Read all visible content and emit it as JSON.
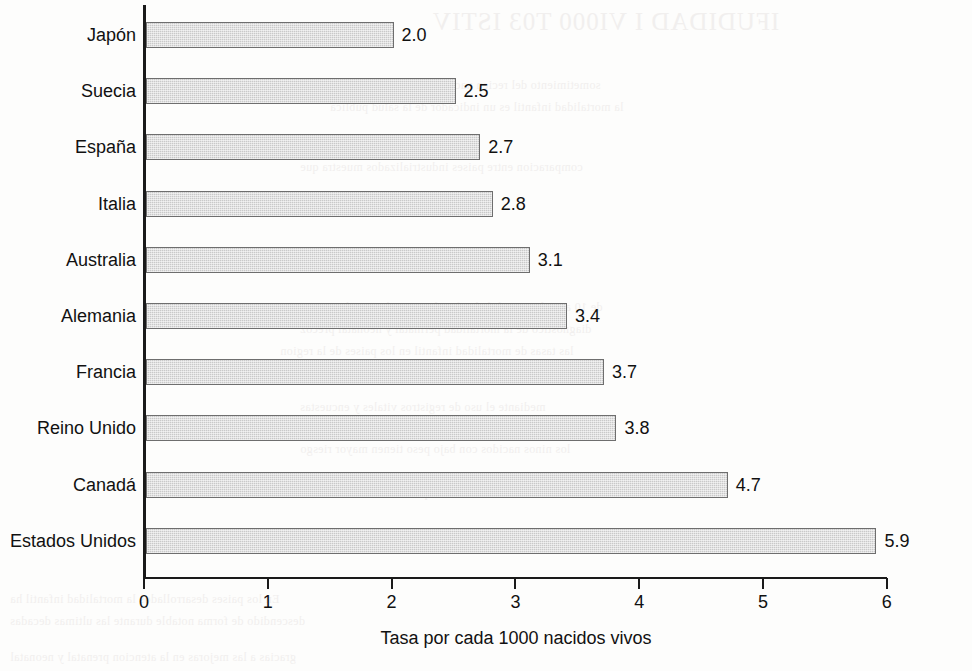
{
  "chart_data": {
    "type": "bar",
    "orientation": "horizontal",
    "title": "",
    "xlabel": "Tasa por cada 1000 nacidos vivos",
    "ylabel": "",
    "xlim": [
      0,
      6
    ],
    "grid": false,
    "legend": false,
    "xticks": [
      "0",
      "1",
      "2",
      "3",
      "4",
      "5",
      "6"
    ],
    "categories": [
      "Japón",
      "Suecia",
      "España",
      "Italia",
      "Australia",
      "Alemania",
      "Francia",
      "Reino Unido",
      "Canadá",
      "Estados Unidos"
    ],
    "values": [
      2.0,
      2.5,
      2.7,
      2.8,
      3.1,
      3.4,
      3.7,
      3.8,
      4.7,
      5.9
    ],
    "value_labels": [
      "2.0",
      "2.5",
      "2.7",
      "2.8",
      "3.1",
      "3.4",
      "3.7",
      "3.8",
      "4.7",
      "5.9"
    ],
    "bar_color": "#c9c9c9",
    "bar_edge_color": "#6e6e6e",
    "axis_color": "#1a1a1a",
    "background": "#fdfdfc"
  },
  "background_bleed": {
    "line_big": "IFUDIDAD  I VI000 T03 ISTIV",
    "line_1": "sometimiento del recien nacido a procedimientos medicos",
    "line_2": "la mortalidad infantil es un indicador de la salud publica",
    "line_3": "comparacion entre paises industrializados muestra que",
    "line_4": "de 10 anos la mortalidad infantil en Estados Unidos es",
    "line_5": "diagnostico de la mortalidad perinatal y neonatal precoz",
    "line_6": "las tasas de mortalidad infantil en los paises de la region",
    "line_7": "mediante el uso de registros vitales y encuestas",
    "line_8": "los ninos nacidos con bajo peso tienen mayor riesgo",
    "line_9": "de morir durante el primer ano de vida",
    "line_10": "En los paises desarrollados la mortalidad infantil ha",
    "line_11": "descendido de forma notable durante las ultimas decadas",
    "line_12": "gracias a las mejoras en la atencion prenatal y neonatal"
  }
}
